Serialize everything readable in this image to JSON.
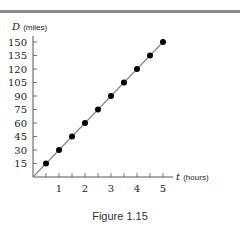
{
  "figure": {
    "caption": "Figure 1.15"
  },
  "chart_data": {
    "type": "scatter",
    "title": "",
    "xlabel_var": "t",
    "xlabel_unit": "(hours)",
    "ylabel_var": "D",
    "ylabel_unit": "(miles)",
    "x_ticks": [
      1,
      2,
      3,
      4,
      5
    ],
    "y_ticks": [
      15,
      30,
      45,
      60,
      75,
      90,
      105,
      120,
      135,
      150
    ],
    "xlim": [
      0,
      5
    ],
    "ylim": [
      0,
      150
    ],
    "grid": false,
    "series": [
      {
        "name": "D",
        "x": [
          0.5,
          1,
          1.5,
          2,
          2.5,
          3,
          3.5,
          4,
          4.5,
          5
        ],
        "y": [
          15,
          30,
          45,
          60,
          75,
          90,
          105,
          120,
          135,
          150
        ]
      }
    ],
    "fit_line": {
      "slope": 30,
      "intercept": 0
    }
  }
}
